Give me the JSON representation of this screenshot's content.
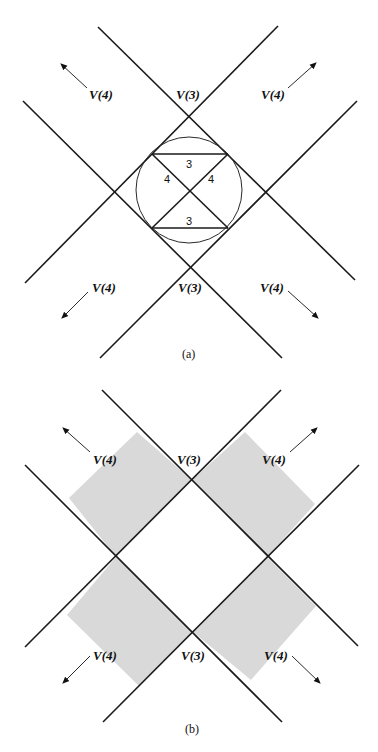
{
  "figure": {
    "panel_a": {
      "caption": "(a)",
      "labels": {
        "top_left": "V(4)",
        "top_center": "V(3)",
        "top_right": "V(4)",
        "bottom_left": "V(4)",
        "bottom_center": "V(3)",
        "bottom_right": "V(4)"
      },
      "edge_labels": {
        "top_chord": "3",
        "left_diag": "4",
        "right_diag": "4",
        "bottom_chord": "3"
      }
    },
    "panel_b": {
      "caption": "(b)",
      "labels": {
        "top_left": "V(4)",
        "top_center": "V(3)",
        "top_right": "V(4)",
        "bottom_left": "V(4)",
        "bottom_center": "V(3)",
        "bottom_right": "V(4)"
      },
      "shade_color": "#d9d9d9"
    }
  }
}
